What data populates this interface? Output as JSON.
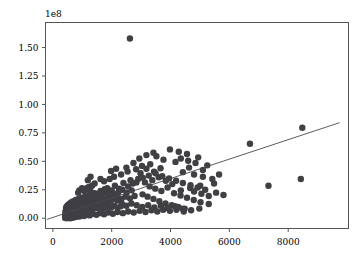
{
  "chart_data": {
    "type": "scatter",
    "title": "",
    "xlabel": "",
    "ylabel": "",
    "y_exponent_label": "1e8",
    "grid": false,
    "legend": null,
    "xlim": [
      -250,
      10050
    ],
    "ylim": [
      -9000000,
      172000000
    ],
    "xticks": [
      0,
      2000,
      4000,
      6000,
      8000
    ],
    "xticklabels": [
      "0",
      "2000",
      "4000",
      "6000",
      "8000"
    ],
    "yticks": [
      0,
      25000000,
      50000000,
      75000000,
      100000000,
      125000000,
      150000000
    ],
    "yticklabels": [
      "0.00",
      "0.25",
      "0.50",
      "0.75",
      "1.00",
      "1.25",
      "1.50"
    ],
    "marker_color": "#3f3f44",
    "marker_size": 5.2,
    "trend_line": {
      "color": "#4a4a4f",
      "x_start": -200,
      "y_start": -1000000,
      "x_end": 9750,
      "y_end": 84000000
    },
    "points": [
      [
        2620,
        158000000
      ],
      [
        8480,
        79500000
      ],
      [
        6700,
        65500000
      ],
      [
        8430,
        34500000
      ],
      [
        7330,
        28500000
      ],
      [
        4560,
        56500000
      ],
      [
        4940,
        53500000
      ],
      [
        4280,
        58500000
      ],
      [
        3980,
        60500000
      ],
      [
        4630,
        44500000
      ],
      [
        5250,
        46500000
      ],
      [
        4170,
        49500000
      ],
      [
        3760,
        51500000
      ],
      [
        3520,
        54500000
      ],
      [
        3310,
        47500000
      ],
      [
        4420,
        40500000
      ],
      [
        4800,
        38500000
      ],
      [
        5100,
        36500000
      ],
      [
        3660,
        44000000
      ],
      [
        3440,
        41000000
      ],
      [
        3180,
        43500000
      ],
      [
        2980,
        39500000
      ],
      [
        5480,
        30500000
      ],
      [
        5010,
        28500000
      ],
      [
        4670,
        26500000
      ],
      [
        4350,
        24500000
      ],
      [
        4060,
        30000000
      ],
      [
        3840,
        33000000
      ],
      [
        3600,
        36000000
      ],
      [
        3380,
        33500000
      ],
      [
        3130,
        31500000
      ],
      [
        2900,
        34500000
      ],
      [
        2720,
        30500000
      ],
      [
        2560,
        28000000
      ],
      [
        2400,
        31000000
      ],
      [
        2250,
        26000000
      ],
      [
        2110,
        28500000
      ],
      [
        1980,
        24500000
      ],
      [
        1850,
        26500000
      ],
      [
        1730,
        22500000
      ],
      [
        1620,
        24000000
      ],
      [
        1510,
        20500000
      ],
      [
        1420,
        22000000
      ],
      [
        1330,
        18500000
      ],
      [
        1250,
        20000000
      ],
      [
        1180,
        16500000
      ],
      [
        1110,
        18000000
      ],
      [
        1050,
        15000000
      ],
      [
        990,
        16500000
      ],
      [
        940,
        13500000
      ],
      [
        890,
        15000000
      ],
      [
        840,
        12000000
      ],
      [
        800,
        13500000
      ],
      [
        760,
        11000000
      ],
      [
        720,
        12500000
      ],
      [
        690,
        10000000
      ],
      [
        660,
        11000000
      ],
      [
        630,
        9000000
      ],
      [
        600,
        10000000
      ],
      [
        580,
        8000000
      ],
      [
        555,
        9000000
      ],
      [
        535,
        7000000
      ],
      [
        515,
        8000000
      ],
      [
        500,
        6000000
      ],
      [
        485,
        7000000
      ],
      [
        470,
        5000000
      ],
      [
        460,
        6000000
      ],
      [
        450,
        4500000
      ],
      [
        1150,
        26500000
      ],
      [
        1220,
        27500000
      ],
      [
        1930,
        34500000
      ],
      [
        2080,
        36500000
      ],
      [
        2320,
        38500000
      ],
      [
        2540,
        41000000
      ],
      [
        2830,
        43000000
      ],
      [
        3030,
        46000000
      ],
      [
        2190,
        20500000
      ],
      [
        2060,
        18500000
      ],
      [
        1900,
        19500000
      ],
      [
        1780,
        17000000
      ],
      [
        1660,
        18500000
      ],
      [
        1560,
        15500000
      ],
      [
        1470,
        17000000
      ],
      [
        1390,
        14000000
      ],
      [
        1310,
        15500000
      ],
      [
        1240,
        13000000
      ],
      [
        1170,
        14500000
      ],
      [
        1100,
        12000000
      ],
      [
        1040,
        13500000
      ],
      [
        980,
        11000000
      ],
      [
        930,
        12500000
      ],
      [
        880,
        10000000
      ],
      [
        830,
        11500000
      ],
      [
        790,
        9000000
      ],
      [
        750,
        10500000
      ],
      [
        710,
        8500000
      ],
      [
        680,
        9500000
      ],
      [
        645,
        7500000
      ],
      [
        615,
        8500000
      ],
      [
        590,
        6500000
      ],
      [
        565,
        7500000
      ],
      [
        545,
        5500000
      ],
      [
        525,
        6500000
      ],
      [
        505,
        4500000
      ],
      [
        490,
        5500000
      ],
      [
        475,
        3500000
      ],
      [
        3290,
        28000000
      ],
      [
        3480,
        26000000
      ],
      [
        3690,
        24000000
      ],
      [
        3900,
        27000000
      ],
      [
        4120,
        22000000
      ],
      [
        4340,
        20000000
      ],
      [
        4560,
        18000000
      ],
      [
        4790,
        16000000
      ],
      [
        5020,
        14000000
      ],
      [
        5300,
        12500000
      ],
      [
        2680,
        24500000
      ],
      [
        2510,
        22500000
      ],
      [
        2360,
        25000000
      ],
      [
        2230,
        23000000
      ],
      [
        2120,
        21000000
      ],
      [
        2010,
        23500000
      ],
      [
        1870,
        21500000
      ],
      [
        1760,
        25500000
      ],
      [
        1650,
        23500000
      ],
      [
        1550,
        21500000
      ],
      [
        1460,
        19500000
      ],
      [
        1380,
        21000000
      ],
      [
        1300,
        18500000
      ],
      [
        1230,
        20000000
      ],
      [
        1160,
        17500000
      ],
      [
        1090,
        19000000
      ],
      [
        1030,
        16500000
      ],
      [
        970,
        18000000
      ],
      [
        920,
        15500000
      ],
      [
        870,
        17000000
      ],
      [
        820,
        14500000
      ],
      [
        780,
        16000000
      ],
      [
        740,
        13500000
      ],
      [
        700,
        15000000
      ],
      [
        665,
        12500000
      ],
      [
        635,
        14000000
      ],
      [
        605,
        11500000
      ],
      [
        575,
        13000000
      ],
      [
        550,
        10500000
      ],
      [
        528,
        12000000
      ],
      [
        508,
        9500000
      ],
      [
        492,
        11000000
      ],
      [
        478,
        8500000
      ],
      [
        465,
        10000000
      ],
      [
        455,
        7500000
      ],
      [
        448,
        9000000
      ],
      [
        442,
        6500000
      ],
      [
        1420,
        30500000
      ],
      [
        1330,
        28500000
      ],
      [
        900,
        24500000
      ],
      [
        860,
        22500000
      ],
      [
        990,
        26500000
      ],
      [
        1070,
        24000000
      ],
      [
        1190,
        25500000
      ],
      [
        1280,
        23500000
      ],
      [
        3050,
        21000000
      ],
      [
        3220,
        19000000
      ],
      [
        3420,
        17000000
      ],
      [
        3620,
        15000000
      ],
      [
        3830,
        13000000
      ],
      [
        4040,
        11500000
      ],
      [
        4260,
        10000000
      ],
      [
        4480,
        8500000
      ],
      [
        2780,
        19500000
      ],
      [
        2620,
        17500000
      ],
      [
        2470,
        19000000
      ],
      [
        2330,
        17000000
      ],
      [
        2200,
        15500000
      ],
      [
        2080,
        17000000
      ],
      [
        1960,
        15000000
      ],
      [
        1840,
        13500000
      ],
      [
        1730,
        15000000
      ],
      [
        1630,
        13000000
      ],
      [
        1540,
        11500000
      ],
      [
        1450,
        13000000
      ],
      [
        1370,
        11000000
      ],
      [
        1290,
        12500000
      ],
      [
        1220,
        10500000
      ],
      [
        1150,
        12000000
      ],
      [
        1080,
        10000000
      ],
      [
        1020,
        11500000
      ],
      [
        960,
        9500000
      ],
      [
        910,
        11000000
      ],
      [
        865,
        9000000
      ],
      [
        820,
        10500000
      ],
      [
        780,
        8500000
      ],
      [
        745,
        10000000
      ],
      [
        712,
        8000000
      ],
      [
        682,
        9500000
      ],
      [
        655,
        7500000
      ],
      [
        628,
        9000000
      ],
      [
        602,
        7000000
      ],
      [
        578,
        8500000
      ],
      [
        557,
        6500000
      ],
      [
        538,
        8000000
      ],
      [
        520,
        6000000
      ],
      [
        504,
        7500000
      ],
      [
        490,
        5500000
      ],
      [
        477,
        7000000
      ],
      [
        466,
        5000000
      ],
      [
        456,
        6500000
      ],
      [
        448,
        4500000
      ],
      [
        441,
        6000000
      ],
      [
        436,
        4000000
      ],
      [
        432,
        5500000
      ],
      [
        1620,
        34500000
      ],
      [
        1740,
        32500000
      ],
      [
        2640,
        33500000
      ],
      [
        2840,
        31500000
      ],
      [
        3060,
        35500000
      ],
      [
        3260,
        37500000
      ],
      [
        3490,
        39500000
      ],
      [
        3720,
        37000000
      ],
      [
        3950,
        35000000
      ],
      [
        4190,
        33000000
      ],
      [
        4420,
        31000000
      ],
      [
        4680,
        29000000
      ],
      [
        4920,
        27000000
      ],
      [
        5180,
        25000000
      ],
      [
        2350,
        12500000
      ],
      [
        2500,
        11000000
      ],
      [
        2670,
        13000000
      ],
      [
        2850,
        11500000
      ],
      [
        3040,
        10000000
      ],
      [
        3240,
        11500000
      ],
      [
        3450,
        9500000
      ],
      [
        3670,
        11000000
      ],
      [
        3900,
        9000000
      ],
      [
        4150,
        10500000
      ],
      [
        4400,
        8500000
      ],
      [
        1880,
        11000000
      ],
      [
        1980,
        9500000
      ],
      [
        2090,
        11000000
      ],
      [
        2200,
        9000000
      ],
      [
        2310,
        10500000
      ],
      [
        1500,
        9000000
      ],
      [
        1600,
        10500000
      ],
      [
        1700,
        8500000
      ],
      [
        1800,
        10000000
      ],
      [
        1180,
        8000000
      ],
      [
        1260,
        9500000
      ],
      [
        1340,
        7500000
      ],
      [
        1420,
        9000000
      ],
      [
        960,
        7000000
      ],
      [
        1020,
        8500000
      ],
      [
        1090,
        6500000
      ],
      [
        1150,
        8000000
      ],
      [
        800,
        6000000
      ],
      [
        850,
        7500000
      ],
      [
        900,
        5500000
      ],
      [
        700,
        5000000
      ],
      [
        740,
        6500000
      ],
      [
        620,
        4500000
      ],
      [
        660,
        6000000
      ],
      [
        560,
        4000000
      ],
      [
        595,
        5500000
      ],
      [
        512,
        3500000
      ],
      [
        540,
        5000000
      ],
      [
        480,
        3000000
      ],
      [
        500,
        4500000
      ],
      [
        460,
        2500000
      ],
      [
        474,
        4000000
      ],
      [
        444,
        2000000
      ],
      [
        455,
        3500000
      ],
      [
        434,
        1500000
      ],
      [
        440,
        3000000
      ],
      [
        428,
        2500000
      ],
      [
        425,
        1000000
      ],
      [
        5650,
        38500000
      ],
      [
        5420,
        34500000
      ],
      [
        5100,
        42500000
      ],
      [
        4850,
        48500000
      ],
      [
        4600,
        50500000
      ],
      [
        4350,
        52500000
      ],
      [
        3180,
        55500000
      ],
      [
        3420,
        57500000
      ],
      [
        2940,
        52500000
      ],
      [
        2740,
        48500000
      ],
      [
        2500,
        44500000
      ],
      [
        1280,
        36500000
      ],
      [
        1190,
        33500000
      ],
      [
        1980,
        41500000
      ],
      [
        2150,
        43500000
      ],
      [
        5550,
        22500000
      ],
      [
        5800,
        20500000
      ],
      [
        5300,
        19500000
      ],
      [
        5050,
        21500000
      ],
      [
        4800,
        23500000
      ],
      [
        4980,
        8500000
      ],
      [
        4700,
        7000000
      ],
      [
        4450,
        6000000
      ],
      [
        4200,
        7500000
      ],
      [
        3980,
        6500000
      ],
      [
        3750,
        7500000
      ],
      [
        3550,
        6000000
      ],
      [
        3350,
        7000000
      ],
      [
        3150,
        5500000
      ],
      [
        2950,
        6500000
      ],
      [
        2750,
        5000000
      ],
      [
        2560,
        6000000
      ],
      [
        2380,
        4500000
      ],
      [
        2200,
        5500000
      ],
      [
        2040,
        4000000
      ],
      [
        1880,
        5000000
      ],
      [
        1740,
        3500000
      ],
      [
        1600,
        4500000
      ],
      [
        1480,
        3000000
      ],
      [
        1360,
        4000000
      ],
      [
        1250,
        2500000
      ],
      [
        1150,
        3500000
      ],
      [
        1060,
        2000000
      ],
      [
        980,
        3000000
      ],
      [
        905,
        1500000
      ],
      [
        840,
        2500000
      ],
      [
        780,
        1000000
      ],
      [
        725,
        2000000
      ],
      [
        675,
        500000
      ],
      [
        630,
        1500000
      ],
      [
        590,
        0
      ],
      [
        555,
        1000000
      ],
      [
        525,
        500000
      ],
      [
        498,
        1500000
      ],
      [
        475,
        0
      ],
      [
        458,
        1000000
      ],
      [
        444,
        500000
      ],
      [
        433,
        1800000
      ],
      [
        426,
        900000
      ],
      [
        421,
        300000
      ]
    ]
  }
}
